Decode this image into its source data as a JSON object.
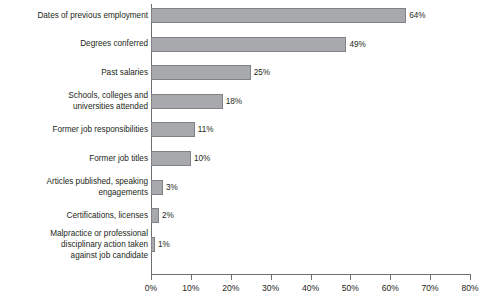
{
  "chart_data": {
    "type": "bar",
    "orientation": "horizontal",
    "title": "",
    "subtitle": "",
    "xlabel": "",
    "ylabel": "",
    "xlim": [
      0,
      80
    ],
    "grid": false,
    "legend": null,
    "xtick_labels": [
      "0%",
      "10%",
      "20%",
      "30%",
      "40%",
      "50%",
      "60%",
      "70%",
      "80%"
    ],
    "xtick_values": [
      0,
      10,
      20,
      30,
      40,
      50,
      60,
      70,
      80
    ],
    "value_suffix": "%",
    "bar_color": "#a7a9ac",
    "bar_border_color": "#808285",
    "axis_color": "#6d6e71",
    "text_color": "#231f20",
    "categories": [
      "Dates of previous employment",
      "Degrees conferred",
      "Past salaries",
      "Schools, colleges and\nuniversities attended",
      "Former job responsibilities",
      "Former job titles",
      "Articles published, speaking\nengagements",
      "Certifications, licenses",
      "Malpractice or professional\ndisciplinary action taken\nagainst job candidate"
    ],
    "values": [
      64,
      49,
      25,
      18,
      11,
      10,
      3,
      2,
      1
    ],
    "value_labels": [
      "64%",
      "49%",
      "25%",
      "18%",
      "11%",
      "10%",
      "3%",
      "2%",
      "1%"
    ]
  }
}
